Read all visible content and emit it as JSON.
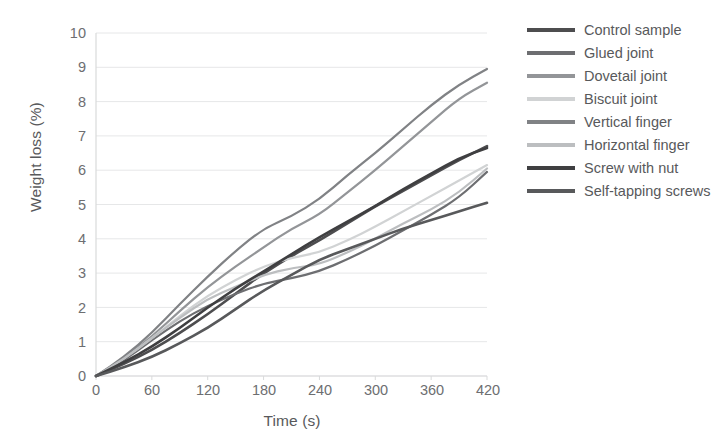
{
  "chart_data": {
    "type": "line",
    "title": "",
    "xlabel": "Time (s)",
    "ylabel": "Weight loss (%)",
    "xlim": [
      0,
      420
    ],
    "ylim": [
      0,
      10
    ],
    "xticks": [
      "0",
      "60",
      "120",
      "180",
      "240",
      "300",
      "360",
      "420"
    ],
    "yticks": [
      "0",
      "1",
      "2",
      "3",
      "4",
      "5",
      "6",
      "7",
      "8",
      "9",
      "10"
    ],
    "grid": "horizontal",
    "legend_position": "right",
    "x": [
      0,
      30,
      60,
      90,
      120,
      150,
      180,
      210,
      240,
      270,
      300,
      330,
      360,
      390,
      420
    ],
    "series": [
      {
        "name": "Control sample",
        "color": "#4d4d4f",
        "values": [
          0.0,
          0.35,
          0.75,
          1.25,
          1.8,
          2.4,
          3.0,
          3.5,
          3.95,
          4.45,
          4.95,
          5.4,
          5.85,
          6.3,
          6.7
        ]
      },
      {
        "name": "Glued joint",
        "color": "#6d6e71",
        "values": [
          0.0,
          0.45,
          1.05,
          1.6,
          2.05,
          2.4,
          2.7,
          2.85,
          3.05,
          3.4,
          3.8,
          4.25,
          4.7,
          5.2,
          5.95
        ]
      },
      {
        "name": "Dovetail joint",
        "color": "#939598",
        "values": [
          0.0,
          0.5,
          1.15,
          1.9,
          2.6,
          3.2,
          3.75,
          4.3,
          4.7,
          5.35,
          6.0,
          6.7,
          7.4,
          8.1,
          8.55
        ]
      },
      {
        "name": "Biscuit joint",
        "color": "#d1d3d4",
        "values": [
          0.0,
          0.5,
          1.1,
          1.75,
          2.35,
          2.8,
          3.2,
          3.45,
          3.6,
          3.95,
          4.35,
          4.8,
          5.25,
          5.7,
          6.15
        ]
      },
      {
        "name": "Vertical finger",
        "color": "#808285",
        "values": [
          0.0,
          0.55,
          1.25,
          2.1,
          2.9,
          3.65,
          4.3,
          4.65,
          5.15,
          5.85,
          6.5,
          7.2,
          7.9,
          8.5,
          8.95
        ]
      },
      {
        "name": "Horizontal finger",
        "color": "#bcbec0",
        "values": [
          0.0,
          0.5,
          1.1,
          1.7,
          2.25,
          2.6,
          2.95,
          3.15,
          3.25,
          3.6,
          4.0,
          4.45,
          4.85,
          5.35,
          6.05
        ]
      },
      {
        "name": "Screw with nut",
        "color": "#3f3f41",
        "values": [
          0.0,
          0.4,
          0.85,
          1.4,
          2.0,
          2.55,
          3.05,
          3.55,
          4.05,
          4.5,
          4.95,
          5.45,
          5.9,
          6.35,
          6.65
        ]
      },
      {
        "name": "Self-tapping screws",
        "color": "#58595b",
        "values": [
          0.0,
          0.25,
          0.55,
          0.95,
          1.4,
          1.95,
          2.5,
          2.95,
          3.4,
          3.7,
          4.0,
          4.3,
          4.55,
          4.8,
          5.05
        ]
      }
    ],
    "axis": {
      "gridline_color": "#e6e7e8",
      "axis_color": "#d9dadb"
    }
  }
}
